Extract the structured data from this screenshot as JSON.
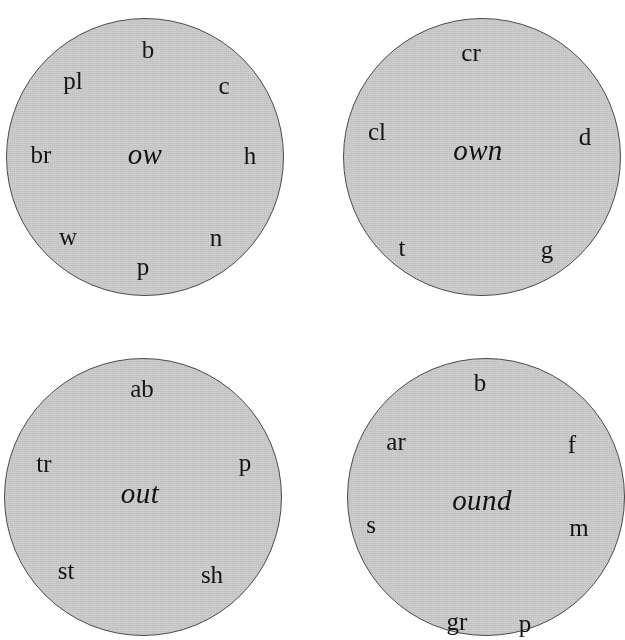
{
  "page": {
    "background_color": "#ffffff",
    "wheel_fill_color": "#cfcfcf",
    "wheel_border_color": "#4a4a4a",
    "text_color": "#141414"
  },
  "wheels": [
    {
      "id": "wheel-ow",
      "rime": "ow",
      "geometry": {
        "cx": 145,
        "cy": 157,
        "r": 139
      },
      "rime_pos": {
        "x": 145,
        "y": 154
      },
      "onsets": [
        {
          "label": "b",
          "x": 148,
          "y": 49
        },
        {
          "label": "pl",
          "x": 73,
          "y": 80
        },
        {
          "label": "c",
          "x": 224,
          "y": 85
        },
        {
          "label": "br",
          "x": 41,
          "y": 154
        },
        {
          "label": "h",
          "x": 250,
          "y": 155
        },
        {
          "label": "w",
          "x": 68,
          "y": 236
        },
        {
          "label": "n",
          "x": 216,
          "y": 237
        },
        {
          "label": "p",
          "x": 143,
          "y": 266
        }
      ]
    },
    {
      "id": "wheel-own",
      "rime": "own",
      "geometry": {
        "cx": 482,
        "cy": 157,
        "r": 139
      },
      "rime_pos": {
        "x": 478,
        "y": 150
      },
      "onsets": [
        {
          "label": "cr",
          "x": 471,
          "y": 52
        },
        {
          "label": "cl",
          "x": 377,
          "y": 131
        },
        {
          "label": "d",
          "x": 585,
          "y": 136
        },
        {
          "label": "t",
          "x": 402,
          "y": 247
        },
        {
          "label": "g",
          "x": 547,
          "y": 249
        }
      ]
    },
    {
      "id": "wheel-out",
      "rime": "out",
      "geometry": {
        "cx": 143,
        "cy": 497,
        "r": 139
      },
      "rime_pos": {
        "x": 140,
        "y": 493
      },
      "onsets": [
        {
          "label": "ab",
          "x": 142,
          "y": 388
        },
        {
          "label": "tr",
          "x": 44,
          "y": 463
        },
        {
          "label": "p",
          "x": 245,
          "y": 462
        },
        {
          "label": "st",
          "x": 66,
          "y": 570
        },
        {
          "label": "sh",
          "x": 212,
          "y": 574
        }
      ]
    },
    {
      "id": "wheel-ound",
      "rime": "ound",
      "geometry": {
        "cx": 486,
        "cy": 497,
        "r": 139
      },
      "rime_pos": {
        "x": 482,
        "y": 500
      },
      "onsets": [
        {
          "label": "b",
          "x": 480,
          "y": 382
        },
        {
          "label": "ar",
          "x": 396,
          "y": 441
        },
        {
          "label": "f",
          "x": 572,
          "y": 444
        },
        {
          "label": "s",
          "x": 371,
          "y": 524
        },
        {
          "label": "m",
          "x": 579,
          "y": 527
        },
        {
          "label": "gr",
          "x": 457,
          "y": 621
        },
        {
          "label": "p",
          "x": 525,
          "y": 623
        }
      ]
    }
  ]
}
